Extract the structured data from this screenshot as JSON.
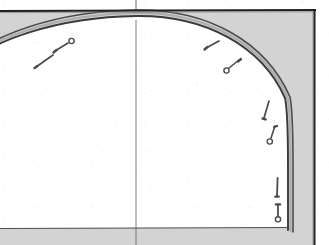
{
  "figure": {
    "type": "engineering-drawing",
    "width": 329,
    "height": 245,
    "background_color": "#ffffff"
  },
  "colors": {
    "rock_mass_fill": "#d3d3d3",
    "excavation_void_fill": "#ffffff",
    "lining_line": "#3a3a3a",
    "outline_dark": "#1f1f1f",
    "bolt_color": "#4a4a4a",
    "centerline_color": "#6b6b6b",
    "invert_line_color": "#4d4d4d",
    "paper_white": "#ffffff"
  },
  "geometry": {
    "crown_y": 16,
    "centerline_x": 136,
    "springline_y": 165,
    "invert_y": 228,
    "right_wall_x": 288,
    "ground_surface_y": 11,
    "right_boundary_x": 314,
    "arch_outer_offset": 5
  },
  "elements": {
    "rock_mass": {
      "name": "rock mass / ground",
      "hatch": "solid grey tone"
    },
    "tunnel_opening": {
      "name": "excavated tunnel opening",
      "shape": "horseshoe arch, half section"
    },
    "lining": {
      "name": "tunnel lining / shotcrete arch",
      "thickness_px": 5
    },
    "centerline": {
      "name": "tunnel vertical centre line",
      "style": "thin continuous"
    },
    "invert": {
      "name": "invert / floor level line",
      "style": "thin continuous"
    },
    "ground_surface": {
      "name": "upper ground boundary line",
      "style": "heavy continuous"
    },
    "right_boundary": {
      "name": "right drawing boundary line",
      "style": "heavy continuous"
    }
  },
  "rock_bolts": [
    {
      "id": "bolt-1",
      "label": "rock bolt",
      "head_x": 36,
      "head_y": 67,
      "tip_x": 53,
      "tip_y": 55,
      "head_type": "plain",
      "length_px": 21
    },
    {
      "id": "bolt-2",
      "label": "rock bolt",
      "head_x": 72,
      "head_y": 41,
      "tip_x": 55,
      "tip_y": 51,
      "head_type": "ring",
      "length_px": 20
    },
    {
      "id": "bolt-3",
      "label": "rock bolt",
      "head_x": 206,
      "head_y": 48,
      "tip_x": 219,
      "tip_y": 41,
      "head_type": "plain",
      "length_px": 15
    },
    {
      "id": "bolt-4",
      "label": "rock bolt",
      "head_x": 228,
      "head_y": 70,
      "tip_x": 239,
      "tip_y": 60,
      "head_type": "ring",
      "length_px": 15
    },
    {
      "id": "bolt-5",
      "label": "rock bolt",
      "head_x": 264,
      "head_y": 118,
      "tip_x": 269,
      "tip_y": 101,
      "head_type": "plain",
      "length_px": 18
    },
    {
      "id": "bolt-6",
      "label": "rock bolt",
      "head_x": 270,
      "head_y": 142,
      "tip_x": 275,
      "tip_y": 126,
      "head_type": "ring",
      "length_px": 17
    },
    {
      "id": "bolt-7",
      "label": "rock bolt",
      "head_x": 277,
      "head_y": 196,
      "tip_x": 277,
      "tip_y": 178,
      "head_type": "plain",
      "length_px": 18
    },
    {
      "id": "bolt-8",
      "label": "rock bolt",
      "head_x": 278,
      "head_y": 219,
      "tip_x": 278,
      "tip_y": 204,
      "head_type": "ring",
      "length_px": 15
    }
  ],
  "bolt_count": 8
}
